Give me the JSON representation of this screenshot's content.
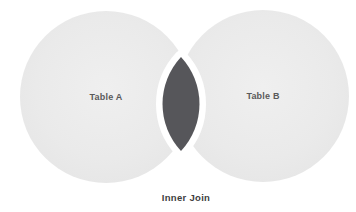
{
  "diagram": {
    "caption": "Inner Join",
    "left_circle": {
      "label": "Table A"
    },
    "right_circle": {
      "label": "Table B"
    },
    "colors": {
      "background": "#ffffff",
      "circle_fill": "#e9e9e9",
      "intersection_fill": "#56565a",
      "intersection_outline": "#ffffff",
      "circle_label_color": "#5a5a5a",
      "caption_color": "#3e3e3e"
    }
  }
}
